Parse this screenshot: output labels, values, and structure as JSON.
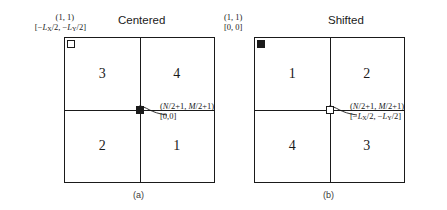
{
  "figure": {
    "panels": [
      {
        "id": "a",
        "title": "Centered",
        "caption": "(a)",
        "corner_label": {
          "index_coords": "(1, 1)",
          "physical_coords": "[−LX/2, −LY/2]",
          "marker": "open-square"
        },
        "center_label": {
          "index_coords": "(N/2+1, M/2+1)",
          "physical_coords": "[0,0]",
          "marker": "filled-square"
        },
        "quadrants": {
          "top_left": "3",
          "top_right": "4",
          "bottom_left": "2",
          "bottom_right": "1"
        }
      },
      {
        "id": "b",
        "title": "Shifted",
        "caption": "(b)",
        "corner_label": {
          "index_coords": "(1, 1)",
          "physical_coords": "[0, 0]",
          "marker": "filled-square"
        },
        "center_label": {
          "index_coords": "(N/2+1, M/2+1)",
          "physical_coords": "[−LX/2, −LY/2]",
          "marker": "open-square"
        },
        "quadrants": {
          "top_left": "1",
          "top_right": "2",
          "bottom_left": "4",
          "bottom_right": "3"
        }
      }
    ],
    "colors": {
      "line": "#1a1a1a",
      "background": "#ffffff",
      "caption": "#3a3a3a"
    }
  }
}
